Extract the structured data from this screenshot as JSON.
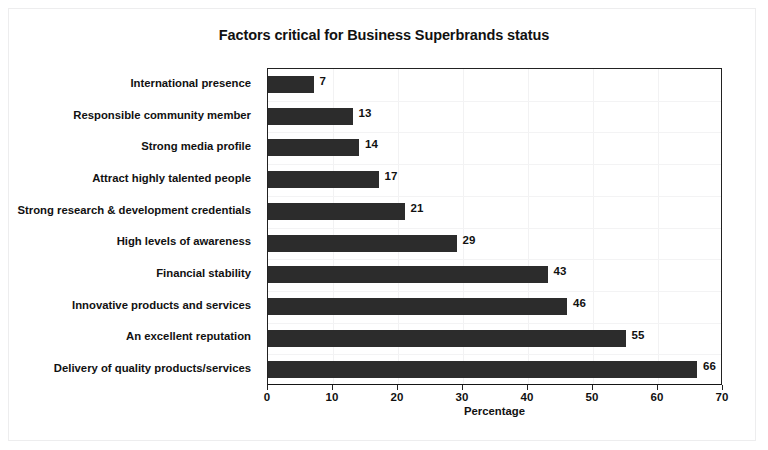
{
  "chart_data": {
    "type": "bar",
    "orientation": "horizontal",
    "title": "Factors critical for Business Superbrands status",
    "xlabel": "Percentage",
    "ylabel": "",
    "xlim": [
      0,
      70
    ],
    "xticks": [
      0,
      10,
      20,
      30,
      40,
      50,
      60,
      70
    ],
    "grid": true,
    "legend": null,
    "bar_color": "#2c2c2c",
    "categories": [
      "International presence",
      "Responsible community member",
      "Strong media profile",
      "Attract highly talented people",
      "Strong research & development credentials",
      "High levels of awareness",
      "Financial stability",
      "Innovative products and services",
      "An excellent reputation",
      "Delivery of quality products/services"
    ],
    "values": [
      7,
      13,
      14,
      17,
      21,
      29,
      43,
      46,
      55,
      66
    ],
    "data_labels": [
      "7",
      "13",
      "14",
      "17",
      "21",
      "29",
      "43",
      "46",
      "55",
      "66"
    ]
  }
}
